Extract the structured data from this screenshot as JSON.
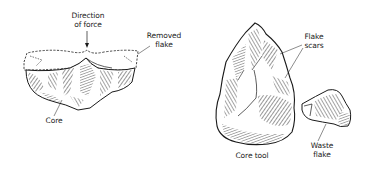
{
  "figure": {
    "left_panel": {
      "title": "Flake removal from core",
      "labels": {
        "direction_line1": "Direction",
        "direction_line2": "of force",
        "removed_line1": "Removed",
        "removed_line2": "flake",
        "core": "Core"
      }
    },
    "right_panel": {
      "title": "Core tool and waste flake",
      "labels": {
        "scars_line1": "Flake",
        "scars_line2": "scars",
        "core_tool": "Core tool",
        "waste_line1": "Waste",
        "waste_line2": "flake"
      }
    },
    "colors": {
      "ink": "#1a1a1a",
      "background": "#ffffff"
    }
  }
}
